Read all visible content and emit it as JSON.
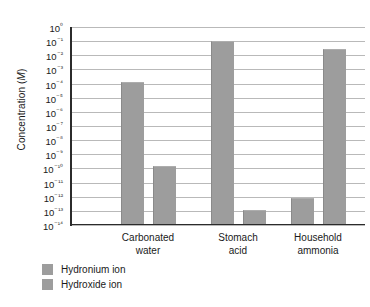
{
  "chart_data": {
    "type": "bar",
    "title": "",
    "xlabel": "",
    "ylabel": "Concentration (M)",
    "ylabel_plain": "Concentration",
    "ylabel_unit": "M",
    "scale": "log",
    "ylim": [
      1e-14,
      1
    ],
    "grid": true,
    "legend_position": "bottom-left",
    "categories": [
      "Carbonated\nwater",
      "Stomach\nacid",
      "Household\nammonia"
    ],
    "tick_labels": [
      "10⁰",
      "10⁻¹",
      "10⁻²",
      "10⁻³",
      "10⁻⁴",
      "10⁻⁵",
      "10⁻⁶",
      "10⁻⁷",
      "10⁻⁸",
      "10⁻⁹",
      "10⁻¹⁰",
      "10⁻¹¹",
      "10⁻¹²",
      "10⁻¹³",
      "10⁻¹⁴"
    ],
    "tick_exponents": [
      0,
      -1,
      -2,
      -3,
      -4,
      -5,
      -6,
      -7,
      -8,
      -9,
      -10,
      -11,
      -12,
      -13,
      -14
    ],
    "series": [
      {
        "name": "Hydronium ion",
        "color": "#9d9d9d",
        "values": [
          0.0001,
          0.1,
          1e-12
        ],
        "exponents": [
          -4,
          -1.1,
          -12.2
        ]
      },
      {
        "name": "Hydroxide ion",
        "color": "#9d9d9d",
        "values": [
          1e-10,
          1e-13,
          0.01
        ],
        "exponents": [
          -10,
          -13.1,
          -1.7
        ]
      }
    ]
  },
  "axis": {
    "y_title_text": "Concentration (",
    "y_title_unit": "M",
    "y_title_close": ")"
  },
  "categories": [
    {
      "line1": "Carbonated",
      "line2": "water"
    },
    {
      "line1": "Stomach",
      "line2": "acid"
    },
    {
      "line1": "Household",
      "line2": "ammonia"
    }
  ],
  "legend": {
    "items": [
      {
        "label": "Hydronium ion",
        "color": "#9d9d9d"
      },
      {
        "label": "Hydroxide ion",
        "color": "#9d9d9d"
      }
    ]
  }
}
